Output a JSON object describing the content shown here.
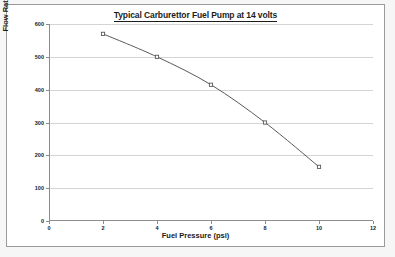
{
  "chart_data": {
    "type": "line",
    "title": "Typical Carburettor Fuel Pump at 14 volts",
    "xlabel": "Fuel Pressure (psi)",
    "ylabel": "Flow Rate (litres per hour)",
    "x": [
      2,
      4,
      6,
      8,
      10
    ],
    "values": [
      570,
      500,
      415,
      300,
      165
    ],
    "series": [
      {
        "name": "Flow Rate",
        "color": "#595959",
        "marker": "square",
        "values": [
          570,
          500,
          415,
          300,
          165
        ]
      }
    ],
    "xlim": [
      0,
      12
    ],
    "ylim": [
      0,
      600
    ],
    "xticks": [
      0,
      2,
      4,
      6,
      8,
      10,
      12
    ],
    "yticks": [
      0,
      100,
      200,
      300,
      400,
      500,
      600
    ],
    "xtick_labels": [
      "0",
      "2",
      "4",
      "6",
      "8",
      "10",
      "12"
    ],
    "ytick_labels": [
      "0",
      "100",
      "200",
      "300",
      "400",
      "500",
      "600"
    ],
    "grid": "horizontal",
    "legend": "none",
    "gridline_color": "#d4d4d4",
    "axis_color": "#8d8d8d",
    "plot_background": "#ffffff"
  }
}
